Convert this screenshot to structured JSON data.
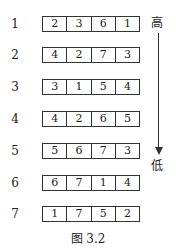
{
  "rows": [
    {
      "label": "1",
      "values": [
        "2",
        "3",
        "6",
        "1"
      ]
    },
    {
      "label": "2",
      "values": [
        "4",
        "2",
        "7",
        "3"
      ]
    },
    {
      "label": "3",
      "values": [
        "3",
        "1",
        "5",
        "4"
      ]
    },
    {
      "label": "4",
      "values": [
        "4",
        "2",
        "6",
        "5"
      ]
    },
    {
      "label": "5",
      "values": [
        "5",
        "6",
        "7",
        "3"
      ]
    },
    {
      "label": "6",
      "values": [
        "6",
        "7",
        "1",
        "4"
      ]
    },
    {
      "label": "7",
      "values": [
        "1",
        "7",
        "5",
        "2"
      ]
    }
  ],
  "arrow": {
    "top_label": "高",
    "bottom_label": "低",
    "icon": "down-arrow-icon"
  },
  "caption": "图 3.2"
}
